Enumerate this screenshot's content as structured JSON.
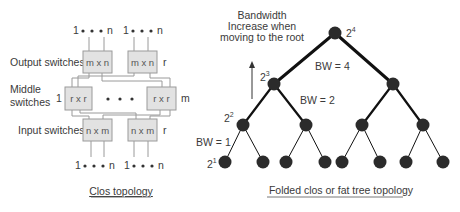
{
  "clos": {
    "output_label": "Output switches",
    "middle_label_line1": "Middle",
    "middle_label_line2": "switches",
    "input_label": "Input switches",
    "port_range_start": "1",
    "port_range_end": "n",
    "output_box_label": "m x n",
    "middle_box_label": "r x r",
    "input_box_label": "n x m",
    "output_count": "r",
    "input_count": "r",
    "middle_first": "1",
    "middle_last": "m",
    "caption": "Clos topology"
  },
  "fat_tree": {
    "annotation_line1": "Bandwidth",
    "annotation_line2": "Increase  when",
    "annotation_line3": "moving to the root",
    "levels": [
      {
        "base": "2",
        "exp": "4"
      },
      {
        "base": "2",
        "exp": "3"
      },
      {
        "base": "2",
        "exp": "2"
      },
      {
        "base": "2",
        "exp": "1"
      }
    ],
    "bw_labels": [
      "BW = 4",
      "BW = 2",
      "BW = 1"
    ],
    "caption": "Folded clos or fat tree topology"
  },
  "colors": {
    "node": "#2b2b2b",
    "switch_fill": "#e2e2e2",
    "switch_stroke": "#9a9a9a",
    "wire": "#9a9a9a",
    "edge": "#111111"
  }
}
